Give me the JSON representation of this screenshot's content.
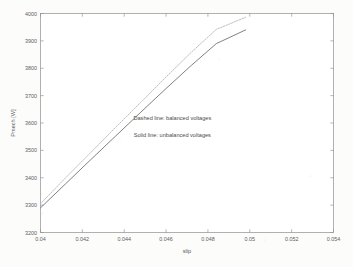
{
  "page": {
    "background_color": "#fcfcfb",
    "kind": "scanned-figure"
  },
  "chart_data": {
    "type": "line",
    "title": "",
    "xlabel": "slip",
    "ylabel": "Pmech [W]",
    "xlim": [
      0.04,
      0.054
    ],
    "ylim": [
      3200,
      4000
    ],
    "xticks": [
      0.04,
      0.042,
      0.044,
      0.046,
      0.048,
      0.05,
      0.052,
      0.054
    ],
    "xtick_labels": [
      "0.04",
      "0.042",
      "0.044",
      "0.046",
      "0.048",
      "0.05",
      "0.052",
      "0.054"
    ],
    "yticks": [
      3200,
      3300,
      3400,
      3500,
      3600,
      3700,
      3800,
      3900,
      4000
    ],
    "ytick_labels": [
      "3200",
      "3300",
      "3400",
      "3500",
      "3600",
      "3700",
      "3800",
      "3900",
      "4000"
    ],
    "grid": false,
    "legend_position": "none",
    "frame": true,
    "series": [
      {
        "name": "balanced voltages",
        "style": "dashed",
        "color": "#b9b9b9",
        "x": [
          0.04,
          0.0412,
          0.0424,
          0.0436,
          0.0448,
          0.046,
          0.0472,
          0.0484,
          0.0498
        ],
        "values": [
          3305,
          3400,
          3492,
          3585,
          3676,
          3768,
          3858,
          3942,
          3986
        ]
      },
      {
        "name": "unbalanced voltages",
        "style": "solid",
        "color": "#7a7a7a",
        "x": [
          0.04,
          0.0412,
          0.0424,
          0.0436,
          0.0448,
          0.046,
          0.0472,
          0.0484,
          0.0498
        ],
        "values": [
          3290,
          3378,
          3466,
          3553,
          3640,
          3726,
          3810,
          3890,
          3940
        ]
      }
    ],
    "annotations": [
      {
        "text": "Dashed line: balanced voltages",
        "x": 0.0463,
        "y": 3612
      },
      {
        "text": "Solid line: unbalanced voltages",
        "x": 0.0463,
        "y": 3548
      }
    ]
  },
  "colors": {
    "axis": "#8f8f8f",
    "tick_text": "#5d5d5d",
    "annotation_text": "#4a4a4a"
  }
}
